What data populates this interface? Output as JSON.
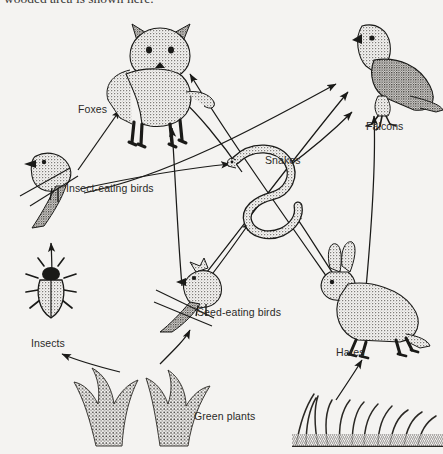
{
  "caption": {
    "text": "wooded area is shown here."
  },
  "diagram": {
    "type": "food-web",
    "background_color": "#f4f3f1",
    "ink_color": "#1a1a18",
    "organisms": [
      {
        "id": "foxes",
        "label": "Foxes",
        "trophic": "predator",
        "art": "fox",
        "x": 160,
        "y": 72
      },
      {
        "id": "falcons",
        "label": "Falcons",
        "trophic": "top-predator",
        "art": "falcon",
        "x": 370,
        "y": 72
      },
      {
        "id": "insect-birds",
        "label": "Insect-eating birds",
        "trophic": "secondary",
        "art": "perched-bird",
        "x": 52,
        "y": 172
      },
      {
        "id": "snakes",
        "label": "Snakes",
        "trophic": "secondary",
        "art": "snake",
        "x": 268,
        "y": 190
      },
      {
        "id": "insects",
        "label": "Insects",
        "trophic": "primary",
        "art": "beetle",
        "x": 50,
        "y": 300
      },
      {
        "id": "seed-birds",
        "label": "Seed-eating birds",
        "trophic": "primary",
        "art": "cardinal",
        "x": 185,
        "y": 295
      },
      {
        "id": "hares",
        "label": "Hares",
        "trophic": "primary",
        "art": "hare",
        "x": 362,
        "y": 305
      },
      {
        "id": "green-plants",
        "label": "Green plants",
        "trophic": "producer",
        "art": "shrubs-and-grass",
        "x": 215,
        "y": 418
      }
    ],
    "arrows": [
      {
        "from": "insects",
        "to": "insect-birds"
      },
      {
        "from": "insect-birds",
        "to": "foxes"
      },
      {
        "from": "insect-birds",
        "to": "snakes"
      },
      {
        "from": "insect-birds",
        "to": "falcons"
      },
      {
        "from": "seed-birds",
        "to": "foxes"
      },
      {
        "from": "seed-birds",
        "to": "snakes"
      },
      {
        "from": "seed-birds",
        "to": "falcons"
      },
      {
        "from": "snakes",
        "to": "foxes"
      },
      {
        "from": "snakes",
        "to": "falcons"
      },
      {
        "from": "hares",
        "to": "foxes"
      },
      {
        "from": "hares",
        "to": "snakes"
      },
      {
        "from": "hares",
        "to": "falcons"
      },
      {
        "from": "green-plants",
        "to": "insects"
      },
      {
        "from": "green-plants",
        "to": "seed-birds"
      },
      {
        "from": "green-plants",
        "to": "hares"
      }
    ]
  }
}
